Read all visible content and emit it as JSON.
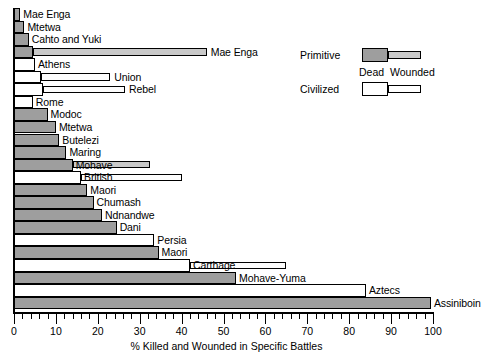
{
  "chart_data": {
    "type": "bar",
    "orientation": "horizontal",
    "stacked": true,
    "title": "",
    "xlabel": "% Killed and Wounded in Specific Battles",
    "ylabel": "",
    "xlim": [
      0,
      100
    ],
    "xticks": [
      0,
      10,
      20,
      30,
      40,
      50,
      60,
      70,
      80,
      90,
      100
    ],
    "xtick_labels": [
      "0",
      "10",
      "20",
      "30",
      "40",
      "50",
      "60",
      "70",
      "80",
      "90",
      "100"
    ],
    "grid": false,
    "legend_position": "upper right",
    "series": [
      {
        "name": "Dead",
        "key": "dead"
      },
      {
        "name": "Wounded",
        "key": "wounded"
      }
    ],
    "groups": [
      {
        "name": "Primitive",
        "color": "#9e9e9e",
        "wounded_color": "#c9c9c9"
      },
      {
        "name": "Civilized",
        "color": "#ffffff",
        "wounded_color": "#ffffff"
      }
    ],
    "categories": [
      "Mae Enga",
      "Mtetwa",
      "Cahto and Yuki",
      "Mae Enga",
      "Athens",
      "Union",
      "Rebel",
      "Rome",
      "Modoc",
      "Mtetwa",
      "Butelezi",
      "Maring",
      "Mohave",
      "British",
      "Maori",
      "Chumash",
      "Ndnandwe",
      "Dani",
      "Persia",
      "Maori",
      "Carthage",
      "Mohave-Yuma",
      "Aztecs",
      "Assiniboin"
    ],
    "bars": [
      {
        "label": "Mae Enga",
        "group": "Primitive",
        "dead": 1.5,
        "wounded": 0
      },
      {
        "label": "Mtetwa",
        "group": "Primitive",
        "dead": 2.5,
        "wounded": 0
      },
      {
        "label": "Cahto and Yuki",
        "group": "Primitive",
        "dead": 3.5,
        "wounded": 0
      },
      {
        "label": "Mae Enga",
        "group": "Primitive",
        "dead": 4.5,
        "wounded": 41.5
      },
      {
        "label": "Athens",
        "group": "Civilized",
        "dead": 5.0,
        "wounded": 0
      },
      {
        "label": "Union",
        "group": "Civilized",
        "dead": 6.5,
        "wounded": 16.5
      },
      {
        "label": "Rebel",
        "group": "Civilized",
        "dead": 7.0,
        "wounded": 19.5
      },
      {
        "label": "Rome",
        "group": "Civilized",
        "dead": 4.5,
        "wounded": 0
      },
      {
        "label": "Modoc",
        "group": "Primitive",
        "dead": 8.0,
        "wounded": 0
      },
      {
        "label": "Mtetwa",
        "group": "Primitive",
        "dead": 10.0,
        "wounded": 0
      },
      {
        "label": "Butelezi",
        "group": "Primitive",
        "dead": 10.8,
        "wounded": 0
      },
      {
        "label": "Maring",
        "group": "Primitive",
        "dead": 12.5,
        "wounded": 0
      },
      {
        "label": "Mohave",
        "group": "Primitive",
        "dead": 14.0,
        "wounded": 18.5
      },
      {
        "label": "British",
        "group": "Civilized",
        "dead": 16.0,
        "wounded": 24.0
      },
      {
        "label": "Maori",
        "group": "Primitive",
        "dead": 17.5,
        "wounded": 0
      },
      {
        "label": "Chumash",
        "group": "Primitive",
        "dead": 19.0,
        "wounded": 0
      },
      {
        "label": "Ndnandwe",
        "group": "Primitive",
        "dead": 21.0,
        "wounded": 0
      },
      {
        "label": "Dani",
        "group": "Primitive",
        "dead": 24.5,
        "wounded": 0
      },
      {
        "label": "Persia",
        "group": "Civilized",
        "dead": 33.5,
        "wounded": 0
      },
      {
        "label": "Maori",
        "group": "Primitive",
        "dead": 34.5,
        "wounded": 0
      },
      {
        "label": "Carthage",
        "group": "Civilized",
        "dead": 42.0,
        "wounded": 23.0
      },
      {
        "label": "Mohave-Yuma",
        "group": "Primitive",
        "dead": 53.0,
        "wounded": 0
      },
      {
        "label": "Aztecs",
        "group": "Civilized",
        "dead": 84.0,
        "wounded": 0
      },
      {
        "label": "Assiniboin",
        "group": "Primitive",
        "dead": 99.5,
        "wounded": 0
      }
    ]
  },
  "legend": {
    "primitive_label": "Primitive",
    "civilized_label": "Civilized",
    "dead_label": "Dead",
    "wounded_label": "Wounded"
  },
  "axis": {
    "title": "% Killed and Wounded in Specific Battles"
  }
}
